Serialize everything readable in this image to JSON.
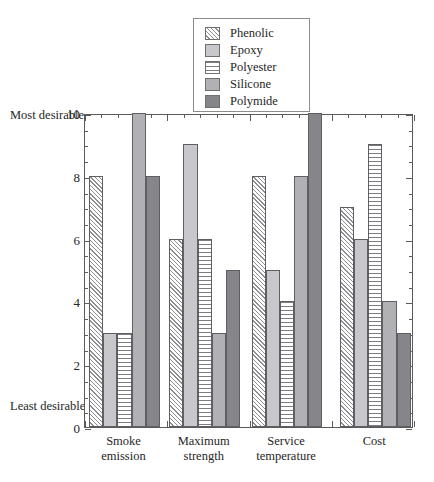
{
  "chart_data": {
    "type": "bar",
    "title": "",
    "xlabel": "",
    "ylabel": "",
    "ylim": [
      0,
      10
    ],
    "ytick_step": 2,
    "yminor_step": 0.5,
    "grid": false,
    "legend_position": "top-center",
    "axis_notes": {
      "top": "Most\ndesirable",
      "top_line1": "Most",
      "top_line2": "desirable",
      "bottom": "Least\ndesirable",
      "bottom_line1": "Least",
      "bottom_line2": "desirable"
    },
    "ytick_labels": [
      "10",
      "8",
      "6",
      "4",
      "2",
      "0"
    ],
    "ytick_values": [
      10,
      8,
      6,
      4,
      2,
      0
    ],
    "categories": [
      "Smoke emission",
      "Maximum strength",
      "Service temperature",
      "Cost"
    ],
    "category_lines": [
      [
        "Smoke",
        "emission"
      ],
      [
        "Maximum",
        "strength"
      ],
      [
        "Service",
        "temperature"
      ],
      [
        "Cost",
        ""
      ]
    ],
    "series": [
      {
        "name": "Phenolic",
        "pattern": "diagonal-hatch",
        "color": "#ffffff",
        "values": [
          8,
          6,
          8,
          7
        ]
      },
      {
        "name": "Epoxy",
        "pattern": "solid-light-gray",
        "color": "#c8c8cc",
        "values": [
          3,
          9,
          5,
          6
        ]
      },
      {
        "name": "Polyester",
        "pattern": "horizontal-lines",
        "color": "#ffffff",
        "values": [
          3,
          6,
          4,
          9
        ]
      },
      {
        "name": "Silicone",
        "pattern": "solid-medium-gray",
        "color": "#b0b0b5",
        "values": [
          10,
          3,
          8,
          4
        ]
      },
      {
        "name": "Polymide",
        "pattern": "solid-dark-gray",
        "color": "#85858a",
        "values": [
          8,
          5,
          10,
          3
        ]
      }
    ]
  },
  "legend": {
    "items": [
      {
        "label": "Phenolic"
      },
      {
        "label": "Epoxy"
      },
      {
        "label": "Polyester"
      },
      {
        "label": "Silicone"
      },
      {
        "label": "Polymide"
      }
    ]
  }
}
